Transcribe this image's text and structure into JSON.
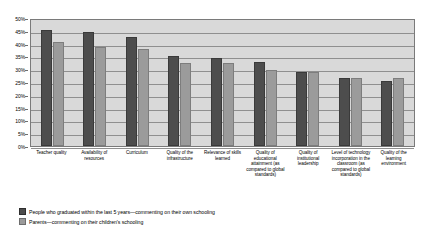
{
  "chart_data": {
    "type": "bar",
    "title": "",
    "xlabel": "",
    "ylabel": "",
    "ylim": [
      0,
      50
    ],
    "grid": true,
    "legend_position": "bottom-left",
    "ytick_labels": [
      "50%",
      "45%",
      "40%",
      "35%",
      "30%",
      "25%",
      "20%",
      "15%",
      "10%",
      "5%",
      "0%"
    ],
    "ytick_values": [
      50,
      45,
      40,
      35,
      30,
      25,
      20,
      15,
      10,
      5,
      0
    ],
    "categories": [
      "Teacher quality",
      "Availability of resources",
      "Curriculum",
      "Quality of the infrastructure",
      "Relevance of skills learned",
      "Quality of educational attainment (as compared to global standards)",
      "Quality of institutional leadership",
      "Level of technology incorporation in the classroom (as compared to global standards)",
      "Quality of the learning environment"
    ],
    "series": [
      {
        "name": "People who graduated within the last 5 years—commenting on their own schooling",
        "color": "#4d4d4d",
        "values": [
          45.5,
          44.5,
          42.5,
          35,
          34.5,
          33,
          29,
          26.5,
          25.5
        ]
      },
      {
        "name": "Parents—commenting on their children's schooling",
        "color": "#9b9b9b",
        "values": [
          40.5,
          38.5,
          38,
          32.5,
          32.5,
          29.5,
          29,
          26.5,
          26.5
        ]
      }
    ]
  }
}
